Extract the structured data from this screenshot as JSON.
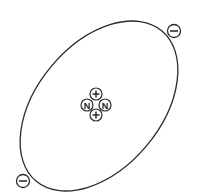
{
  "diagram": {
    "title": "",
    "element": "helium-atom",
    "colors": {
      "stroke": "#2a2a2a",
      "background": "#ffffff"
    },
    "orbit": {
      "cx": 99,
      "cy": 106,
      "rx": 62,
      "ry": 98,
      "rotate": 40
    },
    "nucleus": {
      "particles": [
        {
          "type": "proton",
          "symbol": "+",
          "cx": 96,
          "cy": 94
        },
        {
          "type": "neutron",
          "symbol": "N",
          "cx": 87,
          "cy": 105
        },
        {
          "type": "neutron",
          "symbol": "N",
          "cx": 105,
          "cy": 105
        },
        {
          "type": "proton",
          "symbol": "+",
          "cx": 96,
          "cy": 115
        }
      ]
    },
    "electrons": [
      {
        "symbol": "−",
        "cx": 174,
        "cy": 31
      },
      {
        "symbol": "−",
        "cx": 23,
        "cy": 181
      }
    ]
  }
}
